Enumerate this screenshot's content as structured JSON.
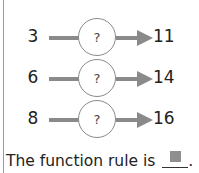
{
  "diagram": {
    "type": "function-machine",
    "machine_symbol": "?",
    "rows": [
      {
        "input": "3",
        "output": "11"
      },
      {
        "input": "6",
        "output": "14"
      },
      {
        "input": "8",
        "output": "16"
      }
    ]
  },
  "prompt": {
    "text": "The function rule is",
    "period": "."
  },
  "colors": {
    "line": "#8a8a8a",
    "blank_square": "#8f8f8f"
  }
}
